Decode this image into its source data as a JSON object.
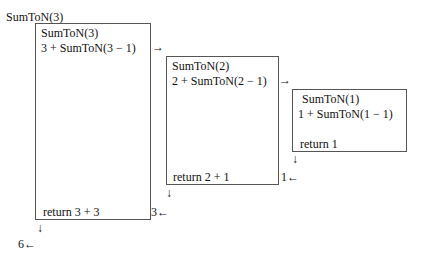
{
  "title": "SumToN(3)",
  "frames": [
    {
      "header": "SumToN(3)",
      "call": "3 + SumToN(3 − 1)",
      "ret": "return 3 + 3",
      "out": "3←"
    },
    {
      "header": "SumToN(2)",
      "call": "2 + SumToN(2 − 1)",
      "ret": "return 2 + 1",
      "out": "1←"
    },
    {
      "header": "SumToN(1)",
      "call": "1 + SumToN(1 − 1)",
      "ret": "return 1"
    }
  ],
  "arrows": {
    "right": "→",
    "down": "↓"
  },
  "final": "6←"
}
